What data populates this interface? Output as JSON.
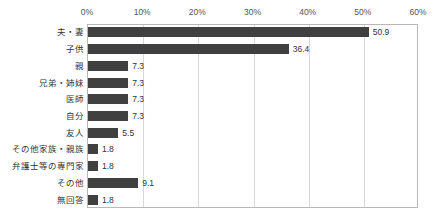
{
  "chart_data": {
    "type": "bar",
    "orientation": "horizontal",
    "title": "",
    "xlabel": "",
    "ylabel": "",
    "xlim": [
      0,
      60
    ],
    "grid": true,
    "legend": false,
    "xticks": [
      "0%",
      "10%",
      "20%",
      "30%",
      "40%",
      "50%",
      "60%"
    ],
    "xtick_values": [
      0,
      10,
      20,
      30,
      40,
      50,
      60
    ],
    "categories": [
      "夫・妻",
      "子供",
      "親",
      "兄弟・姉妹",
      "医師",
      "自分",
      "友人",
      "その他家族・親族",
      "弁護士等の専門家",
      "その他",
      "無回答"
    ],
    "values": [
      50.9,
      36.4,
      7.3,
      7.3,
      7.3,
      7.3,
      5.5,
      1.8,
      1.8,
      9.1,
      1.8
    ],
    "value_labels": [
      "50.9",
      "36.4",
      "7.3",
      "7.3",
      "7.3",
      "7.3",
      "5.5",
      "1.8",
      "1.8",
      "9.1",
      "1.8"
    ]
  },
  "style": {
    "bar_color": "#404040",
    "grid_color": "#d8d8d8",
    "border_color": "#b8b8b8",
    "text_color": "#333333",
    "tick_color": "#555555",
    "background": "#ffffff"
  }
}
